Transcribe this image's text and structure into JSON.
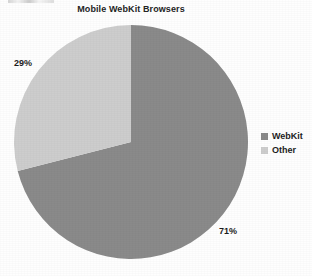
{
  "chart_data": {
    "type": "pie",
    "title": "Mobile WebKit Browsers",
    "xlabel": "",
    "ylabel": "",
    "categories": [
      "WebKit",
      "Other"
    ],
    "values": [
      71,
      29
    ],
    "data_labels": [
      "71%",
      "29%"
    ],
    "units": "percent",
    "start_angle_deg": 0,
    "direction": "clockwise",
    "grid": false,
    "legend_position": "right",
    "slices": [
      {
        "name": "WebKit",
        "value": 71,
        "label": "71%",
        "color": "#8a8a8a",
        "sweep_deg": 255.6,
        "start_deg": 0
      },
      {
        "name": "Other",
        "value": 29,
        "label": "29%",
        "color": "#cdcdcd",
        "sweep_deg": 104.4,
        "start_deg": 255.6
      }
    ]
  },
  "figure": {
    "title": "Mobile WebKit Browsers",
    "background_color": "#fefefe",
    "label_color": "#1d1d1d"
  },
  "labels": {
    "other_percent": "29%",
    "webkit_percent": "71%"
  },
  "legend": {
    "items": [
      {
        "label": "WebKit",
        "color": "#8a8a8a"
      },
      {
        "label": "Other",
        "color": "#cdcdcd"
      }
    ]
  }
}
